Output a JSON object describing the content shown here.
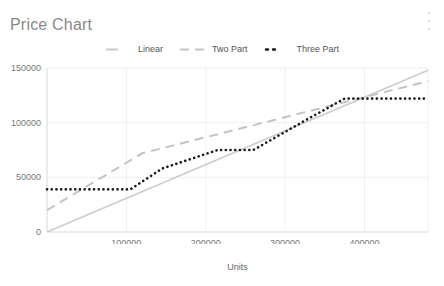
{
  "card": {
    "title": "Price Chart",
    "menu_icon": "kebab-menu-icon"
  },
  "chart_data": {
    "type": "line",
    "title": "Price Chart",
    "xlabel": "Units",
    "ylabel": "",
    "xlim": [
      0,
      480000
    ],
    "ylim": [
      0,
      150000
    ],
    "xticks": [
      100000,
      200000,
      300000,
      400000
    ],
    "xtick_labels": [
      "100000",
      "200000",
      "300000",
      "400000"
    ],
    "yticks": [
      0,
      50000,
      100000,
      150000
    ],
    "ytick_labels": [
      "0",
      "50000",
      "100000",
      "150000"
    ],
    "grid": true,
    "legend_position": "top-center",
    "series": [
      {
        "name": "Linear",
        "style": "solid",
        "color": "#cccccc",
        "x": [
          0,
          480000
        ],
        "y": [
          0,
          148000
        ]
      },
      {
        "name": "Two Part",
        "style": "dashed",
        "color": "#c4c4c4",
        "x": [
          0,
          120000,
          480000
        ],
        "y": [
          20000,
          72000,
          138000
        ]
      },
      {
        "name": "Three Part",
        "style": "dotted",
        "color": "#1a1a1a",
        "x": [
          0,
          105000,
          145000,
          215000,
          260000,
          330000,
          375000,
          480000
        ],
        "y": [
          39000,
          39000,
          58000,
          75000,
          75000,
          104000,
          122000,
          122000
        ]
      }
    ]
  },
  "legend": [
    {
      "label": "Linear",
      "style": "solid",
      "color": "#cccccc"
    },
    {
      "label": "Two Part",
      "style": "dashed",
      "color": "#c4c4c4"
    },
    {
      "label": "Three Part",
      "style": "dotted",
      "color": "#1a1a1a"
    }
  ],
  "axis": {
    "x_title": "Units"
  }
}
